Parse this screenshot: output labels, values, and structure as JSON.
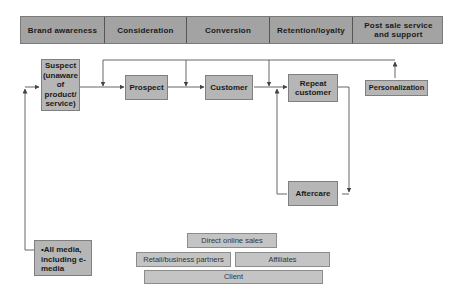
{
  "stages": [
    {
      "label": "Brand awareness",
      "width": 84
    },
    {
      "label": "Consideration",
      "width": 82
    },
    {
      "label": "Conversion",
      "width": 83
    },
    {
      "label": "Retention/loyalty",
      "width": 83
    },
    {
      "label": "Post sale service and support",
      "width": 91
    }
  ],
  "nodes": {
    "suspect": "Suspect (unaware of product/ service)",
    "prospect": "Prospect",
    "customer": "Customer",
    "repeat_customer": "Repeat customer",
    "personalization": "Personalization",
    "aftercare": "Aftercare",
    "media": "•All media, including e-media"
  },
  "channels": {
    "direct_online_sales": "Direct online sales",
    "retail_business_partners": "Retail/business partners",
    "affiliates": "Affiliates",
    "client": "Client"
  },
  "colors": {
    "stage_fill": "#a3a3a3",
    "node_fill": "#b6b6b6",
    "channel_fill": "#c4c4c4",
    "line": "#444444"
  }
}
